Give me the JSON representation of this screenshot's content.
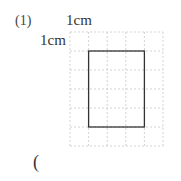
{
  "problem": {
    "number": "(1)",
    "top_unit_label": "1cm",
    "left_unit_label": "1cm",
    "answer_open_paren": "("
  },
  "grid": {
    "columns": 5,
    "rows": 6,
    "cell_size_cm": 1,
    "line_color": "#c8c8c8",
    "line_style": "dashed"
  },
  "rectangle": {
    "width_cm": 3,
    "height_cm": 4,
    "col_start": 1,
    "row_start": 1,
    "stroke_color": "#333333"
  }
}
